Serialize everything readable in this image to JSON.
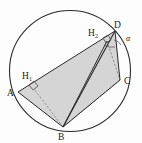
{
  "figure": {
    "background_color": "#fdfdfd",
    "stroke_color": "#2b2b2b",
    "fill_color": "#c9c9c9",
    "fill_opacity": "0.75",
    "dashed_color": "#6e6e6e"
  },
  "circle": {
    "name": "circumcircle",
    "cx": 70,
    "cy": 71,
    "r": 60.5,
    "stroke": "#2b2b2b",
    "stroke_width": 1.1,
    "fill": "none"
  },
  "vertices": [
    {
      "id": "A",
      "label": "A",
      "x": 18,
      "y": 92,
      "label_x": 7,
      "label_y": 96
    },
    {
      "id": "B",
      "label": "B",
      "x": 63,
      "y": 127,
      "label_x": 58,
      "label_y": 140
    },
    {
      "id": "C",
      "label": "C",
      "x": 120,
      "y": 80,
      "label_x": 124,
      "label_y": 84
    },
    {
      "id": "D",
      "label": "D",
      "x": 115,
      "y": 31,
      "label_x": 116,
      "label_y": 28
    }
  ],
  "feet": [
    {
      "id": "H1",
      "label": "H",
      "subscript": "1",
      "x": 34,
      "y": 89,
      "label_x": 22,
      "label_y": 79,
      "sub_x": 30,
      "sub_y": 81
    },
    {
      "id": "H2",
      "label": "H",
      "subscript": "2",
      "x": 107,
      "y": 41,
      "label_x": 88,
      "label_y": 36,
      "sub_x": 96,
      "sub_y": 38
    }
  ],
  "shaded_polygon": {
    "name": "quadrilateral-ADCB",
    "points": "18,92 115,31 120,80 63,127"
  },
  "solid_segments": [
    {
      "name": "segment-A-D",
      "x1": 18,
      "y1": 92,
      "x2": 115,
      "y2": 31
    },
    {
      "name": "segment-D-C",
      "x1": 115,
      "y1": 31,
      "x2": 120,
      "y2": 80
    },
    {
      "name": "segment-C-B",
      "x1": 120,
      "y1": 80,
      "x2": 63,
      "y2": 127
    },
    {
      "name": "segment-B-A",
      "x1": 63,
      "y1": 127,
      "x2": 18,
      "y2": 92
    },
    {
      "name": "segment-B-D",
      "x1": 63,
      "y1": 127,
      "x2": 115,
      "y2": 31
    },
    {
      "name": "segment-B-H2",
      "x1": 63,
      "y1": 127,
      "x2": 107,
      "y2": 41
    }
  ],
  "dashed_segments": [
    {
      "name": "segment-B-H1-dashed",
      "x1": 63,
      "y1": 127,
      "x2": 34,
      "y2": 89
    },
    {
      "name": "segment-B-C-dashed",
      "x1": 63,
      "y1": 127,
      "x2": 120,
      "y2": 80
    },
    {
      "name": "segment-H2-C-dashed",
      "x1": 107,
      "y1": 41,
      "x2": 120,
      "y2": 80
    },
    {
      "name": "segment-D-C-inner-dashed",
      "x1": 115,
      "y1": 31,
      "x2": 120,
      "y2": 80
    }
  ],
  "right_angle_marks": [
    {
      "name": "right-angle-H1",
      "points": "29,85 34,81 38,86 33,90"
    },
    {
      "name": "right-angle-H2",
      "points": "103,38 108,35 111,40 106,43"
    }
  ],
  "angle_alpha": {
    "label": "α",
    "label_x": 127,
    "label_y": 40,
    "arc_path": "M 113 42 A 12 12 0 0 1 121 45",
    "vertex": "D"
  },
  "angle_arc_at_d": {
    "name": "angle-arc-D",
    "path": "M 105 44 A 14 14 0 0 0 116 46"
  }
}
